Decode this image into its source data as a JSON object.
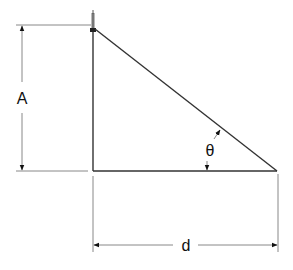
{
  "diagram": {
    "labels": {
      "height": "A",
      "distance": "d",
      "angle": "θ"
    },
    "colors": {
      "line": "#333333",
      "dimension_line": "#888888",
      "background": "#ffffff"
    },
    "geometry": {
      "pole_x": 93,
      "top_y": 25,
      "ground_y": 171,
      "far_x": 277,
      "height_dim_x": 22,
      "distance_dim_y": 244
    }
  }
}
